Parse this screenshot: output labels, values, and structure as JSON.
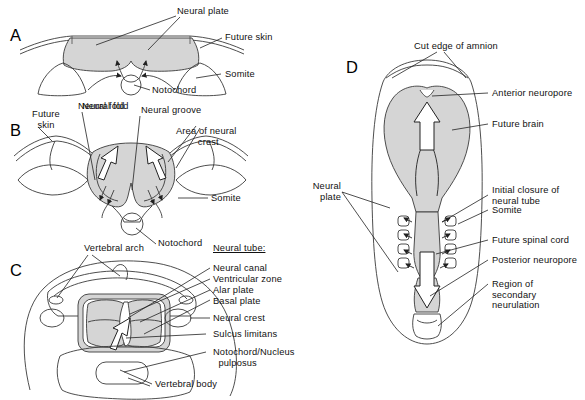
{
  "figure": {
    "type": "embryology-diagram",
    "fill_color": "#d5d5d5",
    "stroke_color": "#3a3a3a",
    "background": "#ffffff"
  },
  "panels": {
    "a": {
      "letter": "A",
      "labels": {
        "neural_plate": "Neural plate",
        "future_skin": "Future skin",
        "somite": "Somite",
        "notochord": "Notochord",
        "neural_fold": "Neural fold"
      }
    },
    "b": {
      "letter": "B",
      "labels": {
        "future_skin": "Future\nskin",
        "neural_fold": "Neural fold",
        "neural_groove": "Neural groove",
        "area_of_neural_crest": "Area of neural\n        crest",
        "somite": "Somite",
        "notochord": "Notochord"
      }
    },
    "c": {
      "letter": "C",
      "labels": {
        "vertebral_arch": "Vertebral arch",
        "neural_tube_header": "Neural tube:",
        "neural_canal": "Neural canal",
        "ventricular_zone": "Ventricular zone",
        "alar_plate": "Alar plate",
        "basal_plate": "Basal plate",
        "neural_crest": "Neural crest",
        "sulcus_limitans": "Sulcus limitans",
        "notochord_nucleus_pulposus": "Notochord/Nucleus\n  pulposus",
        "vertebral_body": "Vertebral body"
      }
    },
    "d": {
      "letter": "D",
      "labels": {
        "cut_edge_of_amnion": "Cut edge of amnion",
        "anterior_neuropore": "Anterior neuropore",
        "future_brain": "Future brain",
        "initial_closure": "Initial closure of\nneural tube",
        "somite": "Somite",
        "future_spinal_cord": "Future spinal cord",
        "posterior_neuropore": "Posterior neuropore",
        "region_of_secondary_neurulation": "Region of\nsecondary\nneurulation",
        "neural_plate": "Neural\nplate"
      }
    }
  }
}
